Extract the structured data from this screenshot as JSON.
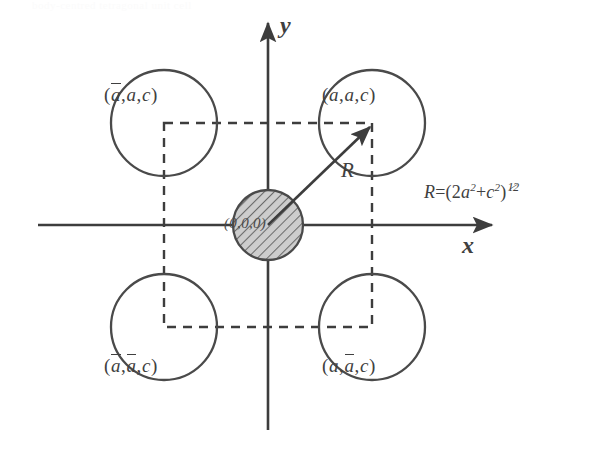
{
  "figure": {
    "type": "diagram",
    "scan_bleed_text": "body-centred tetragonal unit cell",
    "axes": {
      "x_label": "x",
      "y_label": "y",
      "origin_x": 268,
      "origin_y": 225
    },
    "equation": {
      "lhs": "R",
      "relation": "=",
      "rhs_open": "(2",
      "term1_base": "a",
      "term1_exp": "2",
      "plus": "+",
      "term2_base": "c",
      "term2_exp": "2",
      "rhs_close": ")",
      "exp_num": "1",
      "exp_den": "2",
      "full": "R = (2a² + c²)^1/2"
    },
    "radius_label": "R",
    "center_site": {
      "label": "(0,0,0)",
      "fill": "hatched",
      "cx": 268,
      "cy": 225,
      "r": 35
    },
    "corner_sites": [
      {
        "name": "top-left",
        "label_open": "(",
        "a1": "a",
        "a1_bar": true,
        "a2": "a",
        "a2_bar": false,
        "c": "c",
        "label_close": ")",
        "label_text": "(ā,a,c)",
        "cx": 164,
        "cy": 123,
        "r": 53
      },
      {
        "name": "top-right",
        "label_open": "(",
        "a1": "a",
        "a1_bar": false,
        "a2": "a",
        "a2_bar": false,
        "c": "c",
        "label_close": ")",
        "label_text": "(a,a,c)",
        "cx": 372,
        "cy": 123,
        "r": 53
      },
      {
        "name": "bottom-left",
        "label_open": "(",
        "a1": "a",
        "a1_bar": true,
        "a2": "a",
        "a2_bar": true,
        "c": "c",
        "label_close": ")",
        "label_text": "(ā,ā,c)",
        "cx": 164,
        "cy": 327,
        "r": 53
      },
      {
        "name": "bottom-right",
        "label_open": "(",
        "a1": "a",
        "a1_bar": false,
        "a2": "a",
        "a2_bar": true,
        "c": "c",
        "label_close": ")",
        "label_text": "(a,ā,c)",
        "cx": 372,
        "cy": 327,
        "r": 53
      }
    ],
    "dashed_square": {
      "left": 164,
      "top": 123,
      "right": 372,
      "bottom": 327
    },
    "colors": {
      "ink": "#404040",
      "hatch": "#6f6f6f",
      "hatch_fill": "#c9c9c9",
      "background": "#ffffff"
    }
  }
}
